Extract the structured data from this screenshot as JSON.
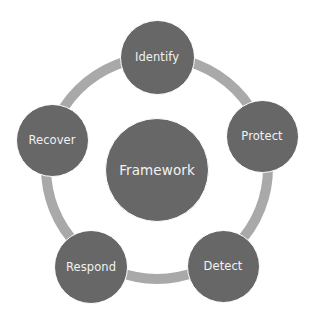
{
  "diagram": {
    "type": "cycle-with-center",
    "colors": {
      "node_fill": "#676767",
      "ring": "#a9a9a9",
      "text": "#f2f2f2",
      "background": "#ffffff"
    },
    "ring": {
      "cx": 157,
      "cy": 168,
      "r": 111,
      "thickness": 10
    },
    "center": {
      "label": "Framework",
      "cx": 157,
      "cy": 170,
      "d": 104
    },
    "nodes": [
      {
        "label": "Identify",
        "cx": 157,
        "cy": 57,
        "d": 75
      },
      {
        "label": "Protect",
        "cx": 262,
        "cy": 136,
        "d": 73
      },
      {
        "label": "Detect",
        "cx": 223,
        "cy": 266,
        "d": 73
      },
      {
        "label": "Respond",
        "cx": 91,
        "cy": 267,
        "d": 74
      },
      {
        "label": "Recover",
        "cx": 52,
        "cy": 140,
        "d": 73
      }
    ]
  }
}
